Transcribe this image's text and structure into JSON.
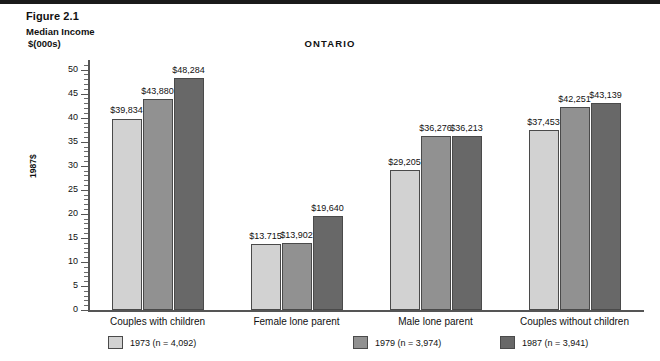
{
  "figure": {
    "number": "Figure 2.1",
    "axis_caption_line1": "Median Income",
    "axis_caption_line2": "$(000s)",
    "y_axis_title": "1987$"
  },
  "chart_data": {
    "type": "bar",
    "title": "ONTARIO",
    "xlabel": "",
    "ylabel": "1987$",
    "ylim": [
      0,
      52
    ],
    "yticks": [
      0,
      5,
      10,
      15,
      20,
      25,
      30,
      35,
      40,
      45,
      50
    ],
    "grid": false,
    "legend_position": "bottom",
    "categories": [
      "Couples with children",
      "Female lone parent",
      "Male lone parent",
      "Couples without children"
    ],
    "series": [
      {
        "name": "1973",
        "legend": "1973  (n = 4,092)",
        "color": "#d2d2d2",
        "values": [
          39.834,
          13.715,
          29.205,
          37.453
        ],
        "labels": [
          "$39,834",
          "$13.715",
          "$29,205",
          "$37,453"
        ]
      },
      {
        "name": "1979",
        "legend": "1979  (n = 3,974)",
        "color": "#919191",
        "values": [
          43.88,
          13.902,
          36.276,
          42.251
        ],
        "labels": [
          "$43,880",
          "$13,902",
          "$36,276",
          "$42,251"
        ]
      },
      {
        "name": "1987",
        "legend": "1987  (n = 3,941)",
        "color": "#686868",
        "values": [
          48.284,
          19.64,
          36.213,
          43.139
        ],
        "labels": [
          "$48,284",
          "$19,640",
          "$36,213",
          "$43,139"
        ]
      }
    ]
  }
}
